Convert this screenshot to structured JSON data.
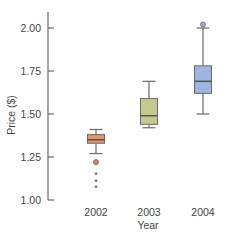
{
  "chart_data": {
    "type": "boxplot",
    "title": "",
    "xlabel": "Year",
    "ylabel": "Price ($)",
    "ylim": [
      1.0,
      2.1
    ],
    "yticks": [
      1.0,
      1.25,
      1.5,
      1.75,
      2.0
    ],
    "ytick_labels": [
      "1.00",
      "1.25",
      "1.50",
      "1.75",
      "2.00"
    ],
    "categories": [
      "2002",
      "2003",
      "2004"
    ],
    "grid": false,
    "series": [
      {
        "name": "2002",
        "color": "#E8956A",
        "whisker_low": 1.27,
        "q1": 1.33,
        "median": 1.35,
        "q3": 1.38,
        "whisker_high": 1.41,
        "outliers": [
          1.22
        ],
        "outlier_color": "#E07A5A",
        "far_outliers": [
          1.15,
          1.11,
          1.07
        ],
        "far_outlier_marker": "star"
      },
      {
        "name": "2003",
        "color": "#C5C98F",
        "whisker_low": 1.42,
        "q1": 1.44,
        "median": 1.49,
        "q3": 1.59,
        "whisker_high": 1.69,
        "outliers": [],
        "far_outliers": []
      },
      {
        "name": "2004",
        "color": "#9DB5E0",
        "whisker_low": 1.5,
        "q1": 1.62,
        "median": 1.69,
        "q3": 1.78,
        "whisker_high": 2.0,
        "outliers": [
          2.02
        ],
        "outlier_color": "#8FA8D8",
        "far_outliers": []
      }
    ]
  }
}
